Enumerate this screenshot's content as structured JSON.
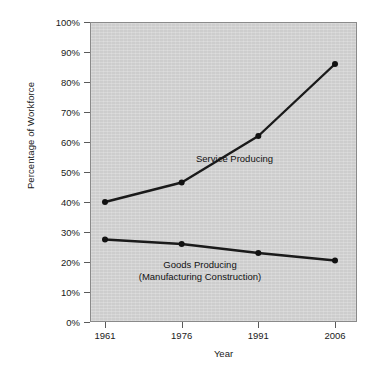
{
  "chart_data": {
    "type": "line",
    "title": "",
    "xlabel": "Year",
    "ylabel": "Percentage of Workforce",
    "x": [
      1961,
      1976,
      1991,
      2006
    ],
    "categories": [
      "1961",
      "1976",
      "1991",
      "2006"
    ],
    "xlim": [
      1961,
      2006
    ],
    "ylim": [
      0,
      100
    ],
    "grid": false,
    "legend_position": "inline-annotations",
    "y_tick_labels": [
      "0%",
      "10%",
      "20%",
      "30%",
      "40%",
      "50%",
      "60%",
      "70%",
      "80%",
      "90%",
      "100%"
    ],
    "y_tick_values": [
      0,
      10,
      20,
      30,
      40,
      50,
      60,
      70,
      80,
      90,
      100
    ],
    "x_tick_labels": [
      "1961",
      "1976",
      "1991",
      "2006"
    ],
    "series": [
      {
        "name": "Service Producing",
        "values": [
          40,
          46.5,
          62,
          86
        ],
        "label_lines": [
          "Service Producing"
        ]
      },
      {
        "name": "Goods Producing (Manufacturing Construction)",
        "values": [
          27.5,
          26,
          23,
          20.5
        ],
        "label_lines": [
          "Goods Producing",
          "(Manufacturing Construction)"
        ]
      }
    ],
    "colors": {
      "plot_background": "#d2d2d2",
      "line": "#1a1a1a",
      "marker": "#111111",
      "frame": "#8a8a8a",
      "text": "#1a1a1a"
    }
  },
  "axes": {
    "y_title": "Percentage of Workforce",
    "x_title": "Year"
  },
  "annotations": {
    "service_label": "Service Producing",
    "goods_label_line1": "Goods Producing",
    "goods_label_line2": "(Manufacturing Construction)"
  }
}
